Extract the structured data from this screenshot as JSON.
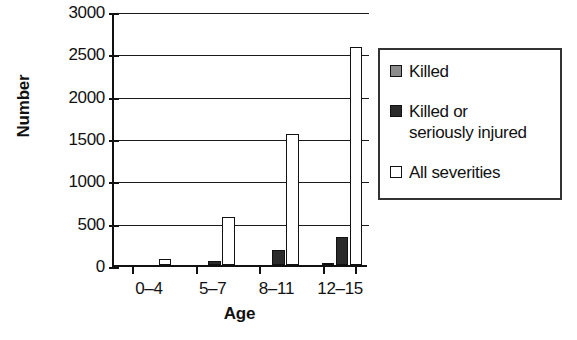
{
  "chart_data": {
    "type": "bar",
    "title": "",
    "xlabel": "Age",
    "ylabel": "Number",
    "categories": [
      "0–4",
      "5–7",
      "8–11",
      "12–15"
    ],
    "series": [
      {
        "name": "Killed",
        "color": "#8c8c8c",
        "values": [
          0,
          0,
          0,
          25
        ]
      },
      {
        "name": "Killed or seriously injured",
        "color": "#2b2b2b",
        "values": [
          0,
          45,
          180,
          330
        ]
      },
      {
        "name": "All severities",
        "color": "#ffffff",
        "values": [
          75,
          570,
          1550,
          2570
        ]
      }
    ],
    "ylim": [
      0,
      3000
    ],
    "yticks": [
      0,
      500,
      1000,
      1500,
      2000,
      2500,
      3000
    ],
    "ytick_labels": [
      "0",
      "500",
      "1000",
      "1500",
      "2000",
      "2500",
      "3000"
    ],
    "grid": true,
    "legend_position": "right"
  },
  "legend": {
    "entries": [
      {
        "label": "Killed",
        "label_line2": ""
      },
      {
        "label": "Killed or",
        "label_line2": "seriously injured"
      },
      {
        "label": "All severities",
        "label_line2": ""
      }
    ]
  }
}
